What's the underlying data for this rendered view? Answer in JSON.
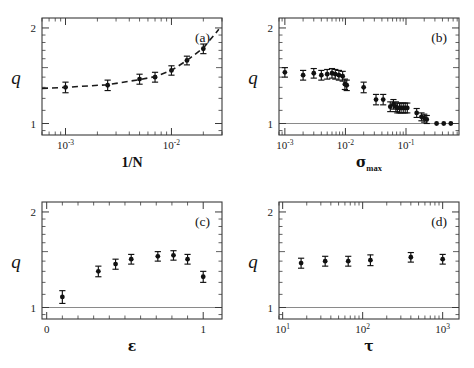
{
  "figure": {
    "background": "#ffffff",
    "marker_color": "#111111",
    "unity_line_color": "#8a8a8a",
    "fit_line_color": "#1a1a1a",
    "axis_color": "#3a3a3a"
  },
  "panels": [
    {
      "tag": "(a)",
      "ylabel": "q",
      "xlabel": "1/N",
      "xticklabels": [
        "10",
        "-3",
        "10",
        "-2"
      ],
      "yticklabels": [
        "2",
        "1"
      ]
    },
    {
      "tag": "(b)",
      "ylabel": "q",
      "xlabel": "σ",
      "xlabel_sub": "max",
      "xticklabels": [
        "10",
        "-3",
        "10",
        "-2",
        "10",
        "-1"
      ],
      "yticklabels": [
        "2",
        "1"
      ]
    },
    {
      "tag": "(c)",
      "ylabel": "q",
      "xlabel": "ε",
      "xticklabels": [
        "0",
        "1"
      ],
      "yticklabels": [
        "2",
        "1"
      ]
    },
    {
      "tag": "(d)",
      "ylabel": "q",
      "xlabel": "τ",
      "xticklabels": [
        "10",
        "1",
        "10",
        "2",
        "10",
        "3"
      ],
      "yticklabels": [
        "2",
        "1"
      ]
    }
  ],
  "chart_data": [
    {
      "type": "scatter",
      "panel": "a",
      "title": "(a)",
      "xlabel": "1/N",
      "ylabel": "q",
      "xscale": "log",
      "yscale": "log",
      "xlim": [
        0.0006,
        0.03
      ],
      "ylim": [
        0.92,
        2.15
      ],
      "xticks": [
        0.001,
        0.01
      ],
      "xticklabels": [
        "10^-3",
        "10^-2"
      ],
      "yticks": [
        1,
        2
      ],
      "yticklabels": [
        "1",
        "2"
      ],
      "grid": false,
      "legend": false,
      "series": [
        {
          "name": "q vs 1/N",
          "x": [
            0.001,
            0.0025,
            0.005,
            0.007,
            0.01,
            0.014,
            0.02
          ],
          "y": [
            1.3,
            1.32,
            1.38,
            1.4,
            1.47,
            1.58,
            1.72
          ],
          "yerr": [
            0.05,
            0.05,
            0.05,
            0.05,
            0.05,
            0.05,
            0.06
          ]
        },
        {
          "name": "fit (dashed)",
          "style": "dashed",
          "x": [
            0.0006,
            0.001,
            0.0025,
            0.005,
            0.007,
            0.01,
            0.014,
            0.02,
            0.028
          ],
          "y": [
            1.29,
            1.3,
            1.325,
            1.375,
            1.405,
            1.47,
            1.58,
            1.73,
            1.98
          ]
        }
      ]
    },
    {
      "type": "scatter",
      "panel": "b",
      "title": "(b)",
      "xlabel": "sigma_max",
      "ylabel": "q",
      "xscale": "log",
      "yscale": "log",
      "xlim": [
        0.0008,
        0.75
      ],
      "ylim": [
        0.92,
        2.15
      ],
      "xticks": [
        0.001,
        0.01,
        0.1
      ],
      "xticklabels": [
        "10^-3",
        "10^-2",
        "10^-1"
      ],
      "yticks": [
        1,
        2
      ],
      "yticklabels": [
        "1",
        "2"
      ],
      "unity_line": 1.0,
      "grid": false,
      "legend": false,
      "series": [
        {
          "name": "q vs sigma_max",
          "x": [
            0.001,
            0.002,
            0.003,
            0.004,
            0.005,
            0.006,
            0.0068,
            0.0078,
            0.009,
            0.0098,
            0.0105,
            0.02,
            0.032,
            0.042,
            0.055,
            0.062,
            0.068,
            0.072,
            0.078,
            0.083,
            0.09,
            0.097,
            0.105,
            0.15,
            0.18,
            0.2,
            0.22,
            0.32,
            0.42,
            0.55
          ],
          "y": [
            1.45,
            1.42,
            1.44,
            1.42,
            1.43,
            1.44,
            1.43,
            1.42,
            1.41,
            1.33,
            1.32,
            1.3,
            1.19,
            1.19,
            1.13,
            1.15,
            1.13,
            1.12,
            1.12,
            1.12,
            1.12,
            1.12,
            1.12,
            1.08,
            1.05,
            1.04,
            1.03,
            1.0,
            1.0,
            1.0
          ],
          "yerr": [
            0.05,
            0.05,
            0.05,
            0.05,
            0.05,
            0.05,
            0.05,
            0.05,
            0.05,
            0.05,
            0.05,
            0.05,
            0.045,
            0.045,
            0.04,
            0.04,
            0.04,
            0.04,
            0.04,
            0.04,
            0.04,
            0.04,
            0.04,
            0.035,
            0.03,
            0.03,
            0.03,
            0.0,
            0.0,
            0.0
          ]
        }
      ]
    },
    {
      "type": "scatter",
      "panel": "c",
      "title": "(c)",
      "xlabel": "epsilon",
      "ylabel": "q",
      "xscale": "linear",
      "yscale": "log",
      "xlim": [
        -0.03,
        1.12
      ],
      "ylim": [
        0.92,
        2.15
      ],
      "xticks": [
        0,
        1
      ],
      "xticklabels": [
        "0",
        "1"
      ],
      "xminorticks": [
        0.1,
        0.2,
        0.3,
        0.4,
        0.5,
        0.6,
        0.7,
        0.8,
        0.9
      ],
      "yticks": [
        1,
        2
      ],
      "yticklabels": [
        "1",
        "2"
      ],
      "unity_line": 1.0,
      "grid": false,
      "legend": false,
      "series": [
        {
          "name": "q vs epsilon",
          "x": [
            0.1,
            0.33,
            0.44,
            0.54,
            0.71,
            0.81,
            0.9,
            1.0
          ],
          "y": [
            1.08,
            1.3,
            1.37,
            1.42,
            1.45,
            1.46,
            1.42,
            1.25
          ],
          "yerr": [
            0.05,
            0.05,
            0.05,
            0.05,
            0.05,
            0.05,
            0.05,
            0.05
          ]
        }
      ]
    },
    {
      "type": "scatter",
      "panel": "d",
      "title": "(d)",
      "xlabel": "tau",
      "ylabel": "q",
      "xscale": "log",
      "yscale": "log",
      "xlim": [
        9,
        1600
      ],
      "ylim": [
        0.92,
        2.15
      ],
      "xticks": [
        10,
        100,
        1000
      ],
      "xticklabels": [
        "10^1",
        "10^2",
        "10^3"
      ],
      "yticks": [
        1,
        2
      ],
      "yticklabels": [
        "1",
        "2"
      ],
      "unity_line": 1.0,
      "grid": false,
      "legend": false,
      "series": [
        {
          "name": "q vs tau",
          "x": [
            17,
            34,
            66,
            125,
            400,
            1000
          ],
          "y": [
            1.38,
            1.4,
            1.4,
            1.41,
            1.44,
            1.42
          ],
          "yerr": [
            0.05,
            0.05,
            0.05,
            0.055,
            0.05,
            0.05
          ]
        }
      ]
    }
  ]
}
